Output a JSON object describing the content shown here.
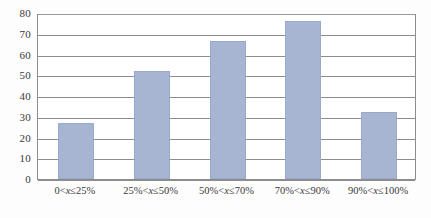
{
  "chart_data": {
    "type": "bar",
    "title": "",
    "xlabel": "",
    "ylabel": "",
    "categories": [
      "0<x≤25%",
      "25%<x≤50%",
      "50%<x≤70%",
      "70%<x≤90%",
      "90%<x≤100%"
    ],
    "values": [
      27,
      52,
      66.5,
      76,
      32.5
    ],
    "ylim": [
      0,
      80
    ],
    "yticks": [
      0,
      10,
      20,
      30,
      40,
      50,
      60,
      70,
      80
    ],
    "ytick_labels": [
      "0",
      "10",
      "20",
      "30",
      "40",
      "50",
      "60",
      "70",
      "80"
    ],
    "grid": true,
    "legend": false,
    "legend_position": "none",
    "series": [
      {
        "name": "",
        "values": [
          27,
          52,
          66.5,
          76,
          32.5
        ]
      }
    ],
    "colors": {
      "bar_fill": "#a7b5d3",
      "bar_edge": "#9aaaca",
      "gridline": "#8d8d8d",
      "axis": "#8d8d8d",
      "text": "#3a3a3a",
      "background": "#ffffff"
    }
  }
}
